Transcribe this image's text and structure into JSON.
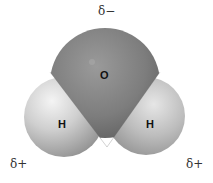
{
  "diagram": {
    "molecule": "water",
    "atoms": [
      {
        "id": "oxygen",
        "symbol": "O",
        "cx": 105,
        "cy": 83,
        "r": 55,
        "color": "#7a7a7a"
      },
      {
        "id": "hydrogen-left",
        "symbol": "H",
        "cx": 64,
        "cy": 117,
        "r": 40,
        "color": "#c8c8c8"
      },
      {
        "id": "hydrogen-right",
        "symbol": "H",
        "cx": 146,
        "cy": 117,
        "r": 39,
        "color": "#c0c0c0"
      }
    ],
    "charges": {
      "oxygen": "δ−",
      "hydrogen_left": "δ+",
      "hydrogen_right": "δ+"
    }
  }
}
